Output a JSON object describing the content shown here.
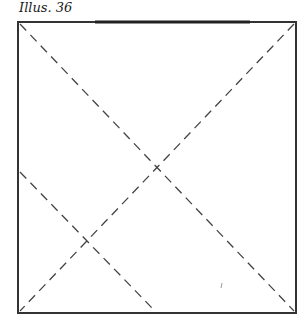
{
  "caption": "Illus. 36",
  "figure": {
    "square": {
      "x1": 18,
      "y1": 22,
      "x2": 296,
      "y2": 313
    },
    "stroke_color": "#333333",
    "dashed_lines": [
      {
        "name": "diagonal-top-left-to-bottom-right",
        "x1": 20,
        "y1": 24,
        "x2": 294,
        "y2": 311
      },
      {
        "name": "diagonal-top-right-to-bottom-left",
        "x1": 294,
        "y1": 24,
        "x2": 20,
        "y2": 311
      },
      {
        "name": "fold-line-left-to-bottom",
        "x1": 20,
        "y1": 172,
        "x2": 153,
        "y2": 309
      }
    ]
  }
}
